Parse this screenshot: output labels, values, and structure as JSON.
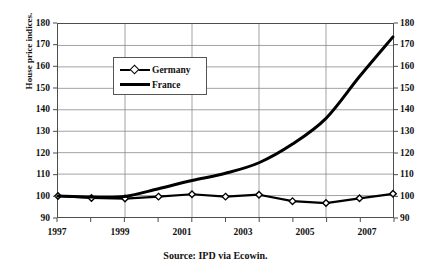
{
  "chart_data": {
    "type": "line",
    "title": "",
    "subtitle": "",
    "xlabel": "",
    "ylabel": "House price indices.",
    "source_note": "Source: IPD via Ecowin.",
    "xlim": [
      1997,
      2007
    ],
    "ylim": [
      90,
      180
    ],
    "ytick_step": 10,
    "xtick_step": 2,
    "grid": true,
    "dual_y_axis": true,
    "legend_position": "upper-left-inside",
    "y_ticks": [
      90,
      100,
      110,
      120,
      130,
      140,
      150,
      160,
      170,
      180
    ],
    "y_ticks_right": [
      90,
      100,
      110,
      120,
      130,
      140,
      150,
      160,
      170,
      180
    ],
    "x_ticks": [
      1997,
      1999,
      2001,
      2003,
      2005,
      2007
    ],
    "x_ticks_minor": [
      1998,
      2000,
      2002,
      2004,
      2006
    ],
    "x": [
      1997,
      1998,
      1999,
      2000,
      2001,
      2002,
      2003,
      2004,
      2005,
      2006,
      2007
    ],
    "series": [
      {
        "name": "Germany",
        "marker": "diamond",
        "color": "#000000",
        "values": [
          99.8,
          98.9,
          98.6,
          99.5,
          100.6,
          99.5,
          100.4,
          97.4,
          96.5,
          98.7,
          100.8
        ]
      },
      {
        "name": "France",
        "marker": "none",
        "color": "#000000",
        "values": [
          99.8,
          99.3,
          99.6,
          103.2,
          107.0,
          110.4,
          115.3,
          124.0,
          136.0,
          155.5,
          174.0
        ]
      }
    ]
  },
  "axes": {
    "y_left_labels": [
      "180",
      "170",
      "160",
      "150",
      "140",
      "130",
      "120",
      "110",
      "100",
      "90"
    ],
    "y_right_labels": [
      "180",
      "170",
      "160",
      "150",
      "140",
      "130",
      "120",
      "110",
      "100",
      "90"
    ],
    "x_labels": [
      "1997",
      "1999",
      "2001",
      "2003",
      "2005",
      "2007"
    ],
    "y_axis_title": "House price indices."
  },
  "legend": {
    "entries": [
      {
        "label": "Germany",
        "style": "line-with-diamond-marker"
      },
      {
        "label": "France",
        "style": "solid-line"
      }
    ]
  },
  "caption": {
    "source": "Source: IPD via Ecowin."
  }
}
